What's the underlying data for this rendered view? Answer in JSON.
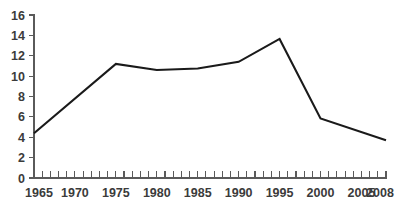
{
  "chart_data": {
    "type": "line",
    "title": "",
    "xlabel": "",
    "ylabel": "",
    "grid": false,
    "legend": false,
    "xlim": [
      1965,
      2008
    ],
    "ylim": [
      0,
      16
    ],
    "y_ticks": [
      0,
      2,
      4,
      6,
      8,
      10,
      12,
      14,
      16
    ],
    "y_tick_labels": [
      "0",
      "2",
      "4",
      "6",
      "8",
      "10",
      "12",
      "14",
      "16"
    ],
    "x_tick_labels": [
      "1965",
      "1970",
      "1975",
      "1980",
      "1985",
      "1990",
      "1995",
      "2000",
      "2005",
      "2008"
    ],
    "x_tick_label_years": [
      1965,
      1970,
      1975,
      1980,
      1985,
      1990,
      1995,
      2000,
      2005,
      2008
    ],
    "x_minor_tick_step": 1,
    "series": [
      {
        "name": "series-1",
        "color": "#1a1a1a",
        "x": [
          1965,
          1975,
          1980,
          1985,
          1990,
          1995,
          2000,
          2008
        ],
        "values": [
          4.4,
          11.2,
          10.6,
          10.75,
          11.4,
          13.65,
          5.85,
          3.7
        ]
      }
    ]
  },
  "style": {
    "line_color": "#1a1a1a",
    "axis_color": "#5a5a5a",
    "text_color": "#3b3b3b",
    "background": "#ffffff"
  }
}
